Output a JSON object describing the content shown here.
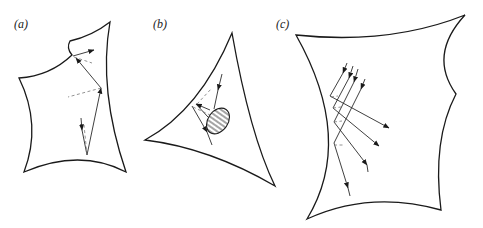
{
  "figure": {
    "panels": [
      {
        "id": "a",
        "label": "(a)",
        "description": "Curved polygonal billiard domain with a ray reflecting off boundaries; dashed lines indicate normals"
      },
      {
        "id": "b",
        "label": "(b)",
        "description": "Curved triangular domain with a hatched elliptical scatterer; rays reflect between boundary and scatterer"
      },
      {
        "id": "c",
        "label": "(c)",
        "description": "Curved quadrilateral domain with a parallel beam of five rays reflecting off a concave left wall"
      }
    ],
    "colors": {
      "background": "#ffffff",
      "stroke": "#1a1a1a",
      "dashed": "#777777"
    }
  }
}
